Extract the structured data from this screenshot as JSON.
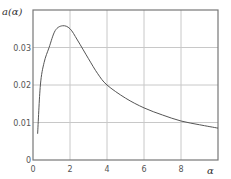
{
  "chart_data": {
    "type": "line",
    "title": "",
    "xlabel": "α",
    "ylabel": "a(α)",
    "xlim": [
      0,
      10
    ],
    "ylim": [
      0,
      0.04
    ],
    "grid": true,
    "legend": null,
    "x_ticks": [
      "0",
      "2",
      "4",
      "6",
      "8"
    ],
    "y_ticks": [
      "0",
      "0.01",
      "0.02",
      "0.03"
    ],
    "series": [
      {
        "name": "a(α)",
        "color": "#555555",
        "x": [
          0.25,
          0.4,
          0.6,
          0.87,
          1.2,
          1.6,
          2.0,
          2.4,
          3.0,
          3.5,
          4.0,
          5.0,
          6.0,
          7.0,
          8.0,
          9.0,
          10.0
        ],
        "y": [
          0.007,
          0.02,
          0.026,
          0.03,
          0.0345,
          0.0358,
          0.035,
          0.032,
          0.027,
          0.023,
          0.02,
          0.0165,
          0.0139,
          0.012,
          0.0104,
          0.0094,
          0.0085
        ]
      }
    ]
  }
}
